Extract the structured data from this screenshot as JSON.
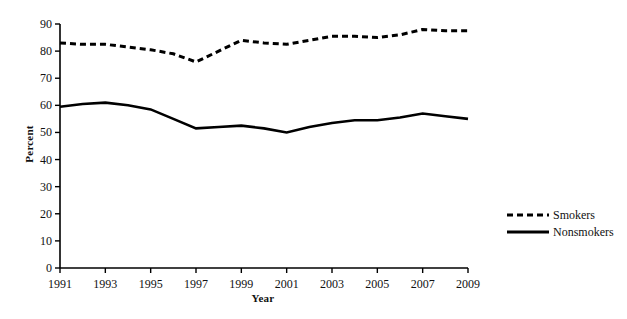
{
  "chart_data": {
    "type": "line",
    "title": "",
    "xlabel": "Year",
    "ylabel": "Percent",
    "xlim": [
      1991,
      2009
    ],
    "ylim": [
      0,
      90
    ],
    "ytick_labels": [
      "0",
      "10",
      "20",
      "30",
      "40",
      "50",
      "60",
      "70",
      "80",
      "90"
    ],
    "yticks": [
      0,
      10,
      20,
      30,
      40,
      50,
      60,
      70,
      80,
      90
    ],
    "xtick_labels": [
      "1991",
      "1993",
      "1995",
      "1997",
      "1999",
      "2001",
      "2003",
      "2005",
      "2007",
      "2009"
    ],
    "xticks": [
      1991,
      1993,
      1995,
      1997,
      1999,
      2001,
      2003,
      2005,
      2007,
      2009
    ],
    "x": [
      1991,
      1992,
      1993,
      1994,
      1995,
      1996,
      1997,
      1998,
      1999,
      2000,
      2001,
      2002,
      2003,
      2004,
      2005,
      2006,
      2007,
      2008,
      2009
    ],
    "grid": false,
    "legend_position": "right",
    "series": [
      {
        "name": "Smokers",
        "style": "dashed",
        "color": "#000000",
        "values": [
          83,
          82.5,
          82.5,
          81.5,
          80.5,
          79,
          76,
          80,
          84,
          83,
          82.5,
          84,
          85.5,
          85.5,
          85,
          86,
          88,
          87.5,
          87.5
        ]
      },
      {
        "name": "Nonsmokers",
        "style": "solid",
        "color": "#000000",
        "values": [
          59.5,
          60.5,
          61,
          60,
          58.5,
          55,
          51.5,
          52,
          52.5,
          51.5,
          50,
          52,
          53.5,
          54.5,
          54.5,
          55.5,
          57,
          56,
          55
        ]
      }
    ]
  },
  "axes": {
    "ylabel": "Percent",
    "xlabel": "Year"
  },
  "legend": {
    "items": [
      {
        "label": "Smokers",
        "style": "dashed"
      },
      {
        "label": "Nonsmokers",
        "style": "solid"
      }
    ]
  }
}
